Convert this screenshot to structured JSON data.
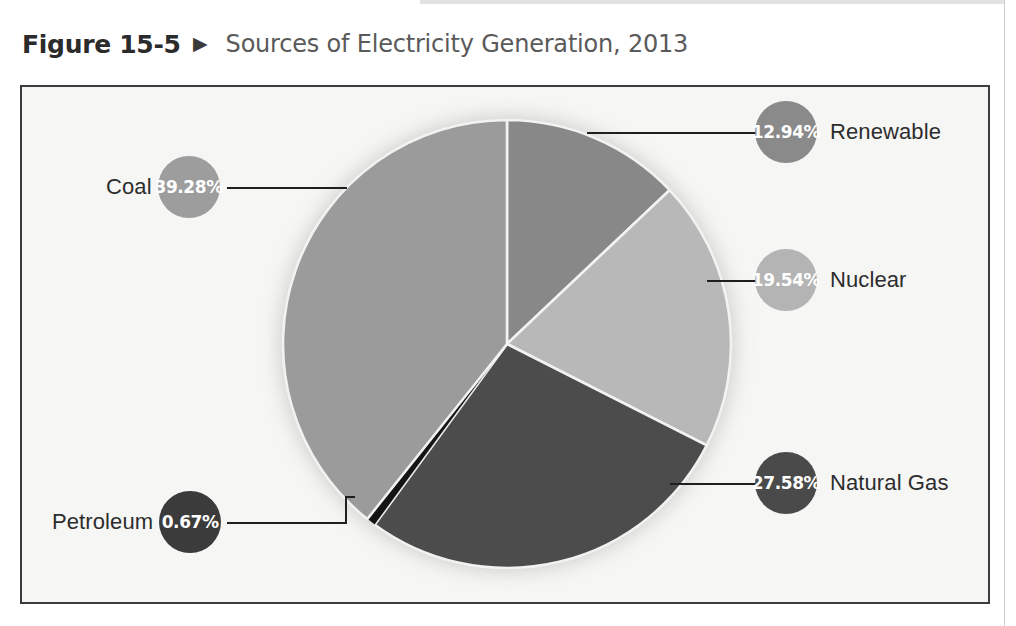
{
  "figure": {
    "number": "Figure 15-5",
    "arrow_icon": "▶",
    "title": "Sources of Electricity Generation, 2013"
  },
  "colors": {
    "coal": "#9b9b9b",
    "renewable": "#888888",
    "nuclear": "#b8b8b8",
    "natural_gas": "#4c4c4c",
    "petroleum": "#141414",
    "frame_border": "#3c3c3c",
    "chart_background": "#f6f6f4",
    "slice_divider": "#f2f2f0",
    "leader_line": "#1f1f1f",
    "label_text": "#2d2d2d",
    "title_text": "#5a5a5a",
    "fignum_text": "#2b2b2b"
  },
  "chart_data": {
    "type": "pie",
    "title": "Sources of Electricity Generation, 2013",
    "subtitle": "",
    "xlabel": "",
    "ylabel": "",
    "unit": "%",
    "legend_position": "callouts",
    "grid": false,
    "categories": [
      "Coal",
      "Natural Gas",
      "Nuclear",
      "Renewable",
      "Petroleum"
    ],
    "values": [
      39.28,
      27.58,
      19.54,
      12.94,
      0.67
    ],
    "slices": [
      {
        "name": "Coal",
        "value": 39.28,
        "label": "39.28%",
        "color": "#9b9b9b"
      },
      {
        "name": "Natural Gas",
        "value": 27.58,
        "label": "27.58%",
        "color": "#4c4c4c"
      },
      {
        "name": "Nuclear",
        "value": 19.54,
        "label": "19.54%",
        "color": "#b8b8b8"
      },
      {
        "name": "Renewable",
        "value": 12.94,
        "label": "12.94%",
        "color": "#888888"
      },
      {
        "name": "Petroleum",
        "value": 0.67,
        "label": "0.67%",
        "color": "#141414"
      }
    ]
  },
  "callouts": {
    "renewable": {
      "pct": "12.94%",
      "name": "Renewable"
    },
    "nuclear": {
      "pct": "19.54%",
      "name": "Nuclear"
    },
    "natural_gas": {
      "pct": "27.58%",
      "name": "Natural Gas"
    },
    "coal": {
      "pct": "39.28%",
      "name": "Coal"
    },
    "petroleum": {
      "pct": "0.67%",
      "name": "Petroleum"
    }
  }
}
